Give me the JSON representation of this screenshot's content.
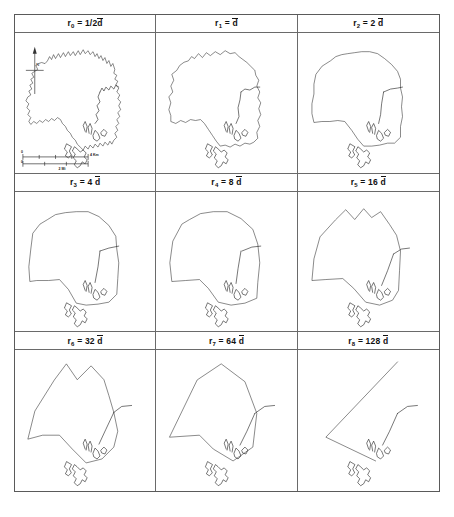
{
  "figure": {
    "type": "map-series",
    "panel_count": 9,
    "rows": 3,
    "columns": 3,
    "border_color": "#5a5a5a",
    "line_color": "#2b2b2b",
    "background": "#ffffff"
  },
  "panels": [
    {
      "id": "panel-r0",
      "symbol": "r",
      "index": "0",
      "equals": "=",
      "factor": "1/2",
      "unit": "d",
      "label_plain": "r0 = 1/2 d̄",
      "tolerance": 0.5,
      "has_compass": true,
      "has_scalebar": true,
      "simplification": 0
    },
    {
      "id": "panel-r1",
      "symbol": "r",
      "index": "1",
      "equals": "=",
      "factor": "",
      "unit": "d",
      "label_plain": "r1 = d̄",
      "tolerance": 1,
      "has_compass": false,
      "has_scalebar": false,
      "simplification": 1
    },
    {
      "id": "panel-r2",
      "symbol": "r",
      "index": "2",
      "equals": "=",
      "factor": "2",
      "unit": "d",
      "label_plain": "r2 = 2 d̄",
      "tolerance": 2,
      "has_compass": false,
      "has_scalebar": false,
      "simplification": 2
    },
    {
      "id": "panel-r3",
      "symbol": "r",
      "index": "3",
      "equals": "=",
      "factor": "4",
      "unit": "d",
      "label_plain": "r3 = 4 d̄",
      "tolerance": 4,
      "has_compass": false,
      "has_scalebar": false,
      "simplification": 3
    },
    {
      "id": "panel-r4",
      "symbol": "r",
      "index": "4",
      "equals": "=",
      "factor": "8",
      "unit": "d",
      "label_plain": "r4 = 8 d̄",
      "tolerance": 8,
      "has_compass": false,
      "has_scalebar": false,
      "simplification": 4
    },
    {
      "id": "panel-r5",
      "symbol": "r",
      "index": "5",
      "equals": "=",
      "factor": "16",
      "unit": "d",
      "label_plain": "r5 = 16 d̄",
      "tolerance": 16,
      "has_compass": false,
      "has_scalebar": false,
      "simplification": 5
    },
    {
      "id": "panel-r6",
      "symbol": "r",
      "index": "6",
      "equals": "=",
      "factor": "32",
      "unit": "d",
      "label_plain": "r6 = 32 d̄",
      "tolerance": 32,
      "has_compass": false,
      "has_scalebar": false,
      "simplification": 6
    },
    {
      "id": "panel-r7",
      "symbol": "r",
      "index": "7",
      "equals": "=",
      "factor": "64",
      "unit": "d",
      "label_plain": "r7 = 64 d̄",
      "tolerance": 64,
      "has_compass": false,
      "has_scalebar": false,
      "simplification": 7
    },
    {
      "id": "panel-r8",
      "symbol": "r",
      "index": "8",
      "equals": "=",
      "factor": "128",
      "unit": "d",
      "label_plain": "r8 = 128 d̄",
      "tolerance": 128,
      "has_compass": false,
      "has_scalebar": false,
      "simplification": 8
    }
  ],
  "compass": {
    "label": "N",
    "name": "north-arrow"
  },
  "scalebar": {
    "km_label": "4 Km",
    "mi_label": "2 Mi",
    "km_zero": "0",
    "mi_zero": "0"
  }
}
